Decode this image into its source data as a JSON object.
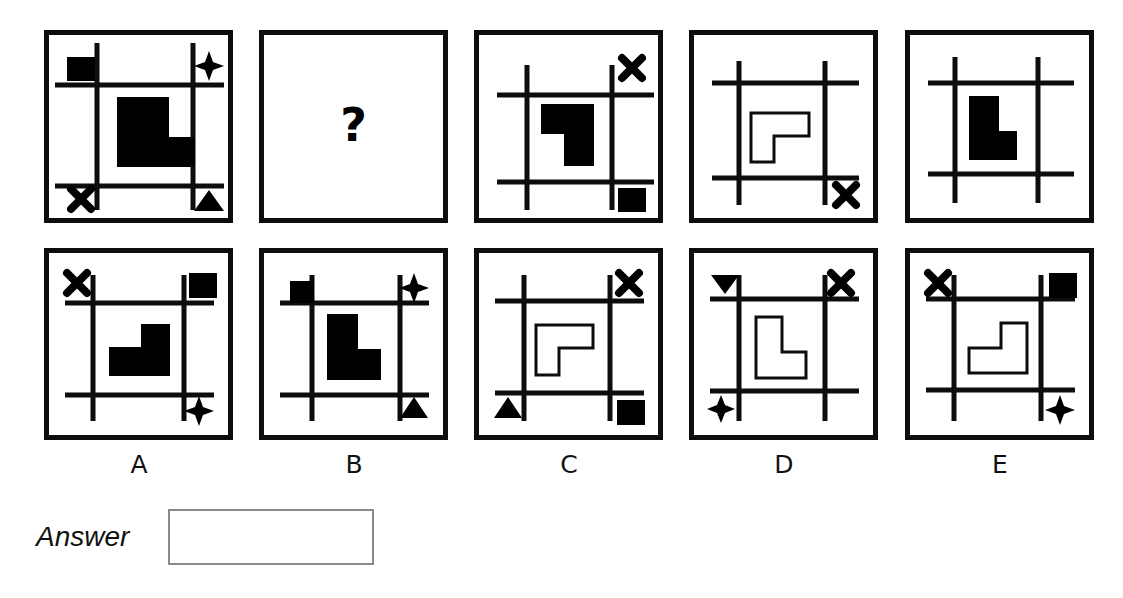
{
  "page": {
    "kind": "non-verbal-reasoning-puzzle",
    "background_color": "#ffffff",
    "ink_color": "#0d0d0d",
    "width": 1123,
    "height": 598
  },
  "question_panel": {
    "marker": "?",
    "position": "top-row-slot-2"
  },
  "answer": {
    "label": "Answer",
    "value": "",
    "placeholder": ""
  },
  "option_labels": [
    "A",
    "B",
    "C",
    "D",
    "E"
  ],
  "grid": {
    "rows": 2,
    "columns": 5,
    "row_roles": [
      "question-sequence",
      "answer-options"
    ]
  },
  "panels": [
    {
      "id": "q1",
      "row": "top",
      "slot": 1,
      "shape": {
        "name": "L-shape",
        "fill": "solid",
        "orientation": "upright"
      },
      "lines": {
        "vertical": 2,
        "horizontal": 2
      },
      "corner_symbols": {
        "top_left": "filled-square",
        "top_right": "four-point-star",
        "bottom_left": "x-cross",
        "bottom_right": "up-triangle"
      }
    },
    {
      "id": "q2",
      "row": "top",
      "slot": 2,
      "shape": {
        "name": "question-mark",
        "fill": "solid",
        "orientation": "none"
      },
      "lines": {
        "vertical": 0,
        "horizontal": 0
      },
      "corner_symbols": {
        "top_left": "",
        "top_right": "",
        "bottom_left": "",
        "bottom_right": ""
      }
    },
    {
      "id": "q3",
      "row": "top",
      "slot": 3,
      "shape": {
        "name": "L-shape",
        "fill": "solid",
        "orientation": "rotated-180"
      },
      "lines": {
        "vertical": 2,
        "horizontal": 2
      },
      "corner_symbols": {
        "top_left": "",
        "top_right": "x-cross",
        "bottom_left": "",
        "bottom_right": "filled-square"
      }
    },
    {
      "id": "q4",
      "row": "top",
      "slot": 4,
      "shape": {
        "name": "L-shape",
        "fill": "outline",
        "orientation": "rotated-180"
      },
      "lines": {
        "vertical": 2,
        "horizontal": 2
      },
      "corner_symbols": {
        "top_left": "",
        "top_right": "",
        "bottom_left": "",
        "bottom_right": "x-cross"
      }
    },
    {
      "id": "q5",
      "row": "top",
      "slot": 5,
      "shape": {
        "name": "L-shape",
        "fill": "solid",
        "orientation": "upright"
      },
      "lines": {
        "vertical": 2,
        "horizontal": 2
      },
      "corner_symbols": {
        "top_left": "",
        "top_right": "",
        "bottom_left": "",
        "bottom_right": ""
      }
    },
    {
      "id": "A",
      "row": "bottom",
      "slot": 1,
      "label": "A",
      "shape": {
        "name": "L-shape",
        "fill": "solid",
        "orientation": "rotated-90"
      },
      "lines": {
        "vertical": 2,
        "horizontal": 2
      },
      "corner_symbols": {
        "top_left": "x-cross",
        "top_right": "filled-square",
        "bottom_left": "",
        "bottom_right": "four-point-star"
      }
    },
    {
      "id": "B",
      "row": "bottom",
      "slot": 2,
      "label": "B",
      "shape": {
        "name": "L-shape",
        "fill": "solid",
        "orientation": "upright"
      },
      "lines": {
        "vertical": 2,
        "horizontal": 2
      },
      "corner_symbols": {
        "top_left": "filled-square",
        "top_right": "four-point-star",
        "bottom_left": "",
        "bottom_right": "up-triangle"
      }
    },
    {
      "id": "C",
      "row": "bottom",
      "slot": 3,
      "label": "C",
      "shape": {
        "name": "L-shape",
        "fill": "outline",
        "orientation": "rotated-180"
      },
      "lines": {
        "vertical": 2,
        "horizontal": 2
      },
      "corner_symbols": {
        "top_left": "",
        "top_right": "x-cross",
        "bottom_left": "up-triangle",
        "bottom_right": "filled-square"
      }
    },
    {
      "id": "D",
      "row": "bottom",
      "slot": 4,
      "label": "D",
      "shape": {
        "name": "L-shape",
        "fill": "outline",
        "orientation": "upright"
      },
      "lines": {
        "vertical": 2,
        "horizontal": 2
      },
      "corner_symbols": {
        "top_left": "down-triangle",
        "top_right": "x-cross",
        "bottom_left": "four-point-star",
        "bottom_right": ""
      }
    },
    {
      "id": "E",
      "row": "bottom",
      "slot": 5,
      "label": "E",
      "shape": {
        "name": "L-shape",
        "fill": "outline",
        "orientation": "rotated-90"
      },
      "lines": {
        "vertical": 2,
        "horizontal": 2
      },
      "corner_symbols": {
        "top_left": "x-cross",
        "top_right": "filled-square",
        "bottom_left": "",
        "bottom_right": "four-point-star"
      }
    }
  ]
}
